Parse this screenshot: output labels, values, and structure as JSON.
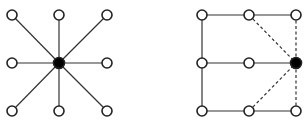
{
  "diagram": {
    "colors": {
      "edge": "#333333",
      "node_fill": "#ffffff",
      "node_stroke": "#222222",
      "center_fill": "#000000"
    },
    "left_graph": {
      "name": "star-graph",
      "center": {
        "x": 59,
        "y": 63
      },
      "nodes": [
        {
          "x": 12,
          "y": 15
        },
        {
          "x": 59,
          "y": 15
        },
        {
          "x": 107,
          "y": 15
        },
        {
          "x": 12,
          "y": 63
        },
        {
          "x": 107,
          "y": 63
        },
        {
          "x": 12,
          "y": 111
        },
        {
          "x": 59,
          "y": 111
        },
        {
          "x": 107,
          "y": 111
        }
      ]
    },
    "right_graph": {
      "name": "grid-graph",
      "center": {
        "x": 296,
        "y": 63
      },
      "nodes": [
        {
          "x": 202,
          "y": 15
        },
        {
          "x": 249,
          "y": 15
        },
        {
          "x": 296,
          "y": 15
        },
        {
          "x": 202,
          "y": 63
        },
        {
          "x": 249,
          "y": 63
        },
        {
          "x": 202,
          "y": 111
        },
        {
          "x": 249,
          "y": 111
        },
        {
          "x": 296,
          "y": 111
        }
      ],
      "solid_edges": [
        [
          202,
          15,
          249,
          15
        ],
        [
          249,
          15,
          296,
          15
        ],
        [
          202,
          63,
          249,
          63
        ],
        [
          249,
          63,
          296,
          63
        ],
        [
          202,
          111,
          249,
          111
        ],
        [
          249,
          111,
          296,
          111
        ],
        [
          202,
          15,
          202,
          63
        ],
        [
          202,
          63,
          202,
          111
        ]
      ],
      "dashed_edges": [
        [
          249,
          15,
          296,
          63
        ],
        [
          296,
          15,
          296,
          63
        ],
        [
          249,
          111,
          296,
          63
        ],
        [
          296,
          111,
          296,
          63
        ]
      ]
    }
  }
}
